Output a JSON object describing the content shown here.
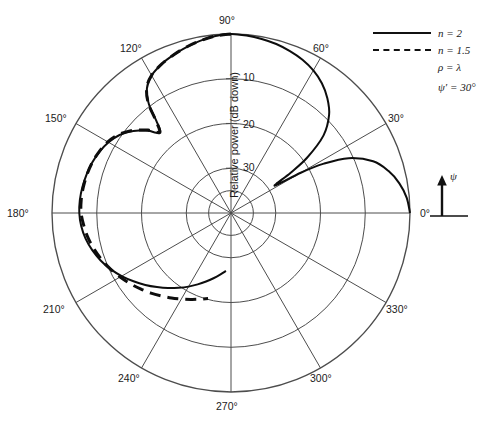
{
  "figure": {
    "type": "polar-radiation-pattern",
    "axis_title": "Relative power (dB down)",
    "radial_ticks": [
      "10",
      "20",
      "30"
    ],
    "angular_labels": [
      "0°",
      "30°",
      "60°",
      "90°",
      "120°",
      "150°",
      "180°",
      "210°",
      "240°",
      "270°",
      "300°",
      "330°"
    ]
  },
  "legend": {
    "entries": [
      {
        "key": "solid",
        "label": "n = 2"
      },
      {
        "key": "dashed",
        "label": "n = 1.5"
      },
      {
        "key": "none",
        "label": "ρ = λ"
      },
      {
        "key": "none",
        "label": "ψ′ = 30°"
      }
    ]
  },
  "orientation_indicator": {
    "arrow_label": "ψ",
    "baseline_label": "0°"
  },
  "colors": {
    "grid": "#4d4d4d",
    "curve": "#0d0d0d",
    "background": "#ffffff",
    "text": "#1b1b1b"
  },
  "chart_data": {
    "type": "line",
    "title": "",
    "subtitle": "",
    "xlabel": "",
    "ylabel": "Relative power (dB down)",
    "projection": "polar",
    "grid": true,
    "legend_position": "top-right",
    "angular_axis": {
      "unit": "degrees",
      "direction": "counterclockwise",
      "zero_at": "east",
      "tick_step": 30,
      "ticks": [
        0,
        30,
        60,
        90,
        120,
        150,
        180,
        210,
        240,
        270,
        300,
        330
      ]
    },
    "radial_axis": {
      "label": "Relative power (dB down)",
      "unit": "dB down",
      "outer_value": 0,
      "center_value": 40,
      "rings_db": [
        10,
        20,
        30
      ],
      "ring_label_angle_deg": 90,
      "rlim": [
        40,
        0
      ]
    },
    "series": [
      {
        "name": "n = 2",
        "style": "solid",
        "color": "#0d0d0d",
        "theta_deg": [
          0,
          5,
          10,
          15,
          20,
          25,
          28,
          30,
          32,
          34,
          36,
          40,
          45,
          50,
          55,
          60,
          65,
          70,
          75,
          80,
          85,
          90,
          95,
          100,
          105,
          110,
          115,
          120,
          124,
          127,
          129,
          131,
          133,
          135,
          137,
          140,
          145,
          150,
          155,
          160,
          165,
          170,
          175,
          180,
          185,
          190,
          195,
          200,
          205,
          210,
          215,
          220,
          225,
          230,
          235,
          240,
          245,
          250,
          255,
          260,
          265
        ],
        "r_db_down": [
          0.0,
          0.6,
          1.8,
          3.6,
          6.2,
          11.0,
          16.5,
          22.0,
          28.5,
          24.0,
          19.0,
          13.0,
          9.0,
          6.5,
          4.6,
          3.2,
          2.2,
          1.5,
          0.9,
          0.5,
          0.2,
          0.0,
          0.3,
          0.9,
          1.6,
          2.4,
          3.3,
          4.5,
          6.4,
          9.5,
          13.5,
          16.0,
          15.5,
          14.0,
          13.0,
          11.5,
          9.6,
          8.4,
          7.6,
          7.0,
          6.6,
          6.3,
          6.1,
          6.1,
          6.4,
          7.0,
          7.9,
          9.0,
          10.3,
          11.8,
          13.4,
          15.0,
          16.6,
          18.1,
          19.6,
          21.0,
          22.4,
          23.7,
          24.9,
          26.0,
          27.0
        ]
      },
      {
        "name": "n = 1.5",
        "style": "dashed",
        "color": "#0d0d0d",
        "theta_deg": [
          90,
          95,
          100,
          105,
          110,
          115,
          120,
          124,
          127,
          129,
          131,
          133,
          135,
          137,
          140,
          145,
          150,
          155,
          160,
          165,
          170,
          175,
          180,
          185,
          190,
          195,
          200,
          205,
          210,
          215,
          220,
          225,
          230,
          235,
          240,
          245,
          250,
          255
        ],
        "r_db_down": [
          0.0,
          0.3,
          0.9,
          1.6,
          2.4,
          3.3,
          4.5,
          6.3,
          9.3,
          13.2,
          15.7,
          15.3,
          13.8,
          12.8,
          11.3,
          9.4,
          8.2,
          7.5,
          7.0,
          6.7,
          6.5,
          6.4,
          6.5,
          7.0,
          7.6,
          8.4,
          9.3,
          10.3,
          11.4,
          12.5,
          13.6,
          14.7,
          15.8,
          16.8,
          17.8,
          18.7,
          19.5,
          20.2
        ]
      }
    ],
    "annotations": [
      {
        "text": "ρ = λ",
        "kind": "parameter"
      },
      {
        "text": "ψ′ = 30°",
        "kind": "parameter"
      },
      {
        "text": "ψ",
        "kind": "axis-arrow"
      }
    ]
  }
}
